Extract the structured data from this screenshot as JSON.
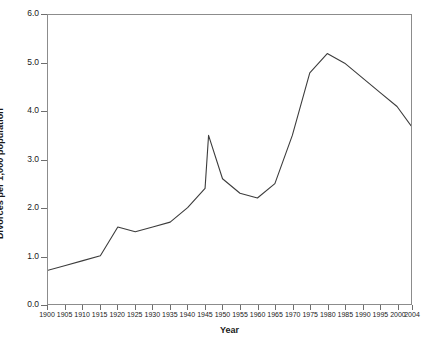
{
  "chart_data": {
    "type": "line",
    "title": "",
    "xlabel": "Year",
    "ylabel": "Divorces per 1,000 population",
    "xlim": [
      1900,
      2004
    ],
    "ylim": [
      0.0,
      6.0
    ],
    "grid": false,
    "legend": null,
    "line_color": "#3c3c3c",
    "frame_color": "#8c8c8c",
    "xticks": [
      1900,
      1905,
      1910,
      1915,
      1920,
      1925,
      1930,
      1935,
      1940,
      1945,
      1950,
      1955,
      1960,
      1965,
      1970,
      1975,
      1980,
      1985,
      1990,
      1995,
      2000,
      2004
    ],
    "xtick_labels": [
      "1900",
      "1905",
      "1910",
      "1915",
      "1920",
      "1925",
      "1930",
      "1935",
      "1940",
      "1945",
      "1950",
      "1955",
      "1960",
      "1965",
      "1970",
      "1975",
      "1980",
      "1985",
      "1990",
      "1995",
      "2000",
      "2004"
    ],
    "yticks": [
      0.0,
      1.0,
      2.0,
      3.0,
      4.0,
      5.0,
      6.0
    ],
    "ytick_labels": [
      "0.0",
      "1.0",
      "2.0",
      "3.0",
      "4.0",
      "5.0",
      "6.0"
    ],
    "x": [
      1900,
      1905,
      1910,
      1915,
      1920,
      1925,
      1930,
      1935,
      1940,
      1945,
      1946,
      1950,
      1955,
      1960,
      1965,
      1970,
      1975,
      1980,
      1985,
      1990,
      1995,
      2000,
      2004
    ],
    "values": [
      0.7,
      0.8,
      0.9,
      1.0,
      1.6,
      1.5,
      1.6,
      1.7,
      2.0,
      2.4,
      3.5,
      2.6,
      2.3,
      2.2,
      2.5,
      3.5,
      4.8,
      5.2,
      5.0,
      4.7,
      4.4,
      4.1,
      3.7
    ],
    "series": [
      {
        "name": "Divorce rate",
        "values": [
          0.7,
          0.8,
          0.9,
          1.0,
          1.6,
          1.5,
          1.6,
          1.7,
          2.0,
          2.4,
          3.5,
          2.6,
          2.3,
          2.2,
          2.5,
          3.5,
          4.8,
          5.2,
          5.0,
          4.7,
          4.4,
          4.1,
          3.7
        ]
      }
    ]
  }
}
